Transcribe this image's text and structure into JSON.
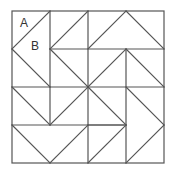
{
  "diagram": {
    "title": "",
    "labels": {
      "a": "A",
      "b": "B"
    },
    "line_color": "#555555",
    "background": "#ffffff"
  }
}
